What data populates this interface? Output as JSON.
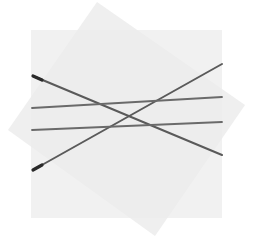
{
  "figure": {
    "canvas": {
      "width": 255,
      "height": 247,
      "background_color": "#ffffff"
    },
    "shapes": [
      {
        "name": "rotated-square",
        "type": "polygon",
        "description": "Light gray square rotated about 20 degrees clockwise",
        "fill_color": "#efefef",
        "points": "97,2 245,105 155,236 8,130"
      },
      {
        "name": "aligned-square",
        "type": "rect",
        "description": "Axis aligned light gray square overlapping the rotated square",
        "fill_color": "#ebebeb",
        "x": 31,
        "y": 30,
        "width": 191,
        "height": 188
      }
    ],
    "lines": [
      {
        "name": "line-descending",
        "color": "#5a5a5a",
        "width": 2.0,
        "x1": 33,
        "y1": 76,
        "x2": 222,
        "y2": 155
      },
      {
        "name": "line-ascending-steep",
        "color": "#5a5a5a",
        "width": 2.0,
        "x1": 33,
        "y1": 170,
        "x2": 222,
        "y2": 64
      },
      {
        "name": "line-shallow-upper",
        "color": "#6a6a6a",
        "width": 1.8,
        "x1": 32,
        "y1": 108,
        "x2": 222,
        "y2": 97
      },
      {
        "name": "line-shallow-lower",
        "color": "#6a6a6a",
        "width": 1.8,
        "x1": 32,
        "y1": 130,
        "x2": 222,
        "y2": 122
      }
    ],
    "endpoint_marks": [
      {
        "name": "endpoint-upper-left",
        "color": "#2a2a2a",
        "width": 3.2,
        "x1": 33,
        "y1": 76,
        "x2": 42,
        "y2": 80
      },
      {
        "name": "endpoint-lower-left",
        "color": "#2a2a2a",
        "width": 3.2,
        "x1": 33,
        "y1": 170,
        "x2": 42,
        "y2": 165
      }
    ]
  }
}
